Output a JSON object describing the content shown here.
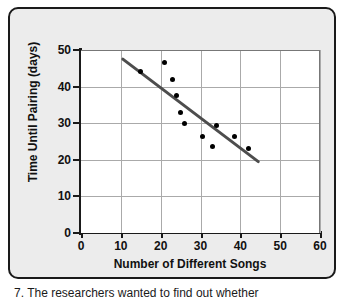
{
  "chart_data": {
    "type": "scatter",
    "title": "",
    "xlabel": "Number of Different Songs",
    "ylabel": "Time Until Pairing (days)",
    "xlim": [
      0,
      60
    ],
    "ylim": [
      0,
      50
    ],
    "xticks": [
      0,
      10,
      20,
      30,
      40,
      50,
      60
    ],
    "yticks": [
      0,
      10,
      20,
      30,
      40,
      50
    ],
    "grid": true,
    "legend": "none",
    "points": [
      {
        "x": 15,
        "y": 44
      },
      {
        "x": 21,
        "y": 46.5
      },
      {
        "x": 23,
        "y": 42
      },
      {
        "x": 24,
        "y": 37.5
      },
      {
        "x": 25,
        "y": 33
      },
      {
        "x": 26,
        "y": 30
      },
      {
        "x": 30.5,
        "y": 26.5
      },
      {
        "x": 33,
        "y": 23.5
      },
      {
        "x": 34,
        "y": 29.5
      },
      {
        "x": 38.5,
        "y": 26.5
      },
      {
        "x": 42,
        "y": 23
      }
    ],
    "trendline": {
      "x0": 10.5,
      "y0": 47.5,
      "x1": 44.5,
      "y1": 19.5,
      "color": "#4d4d4d"
    },
    "marker_color": "#000000",
    "grid_color": "#aaaaaa",
    "axis_color": "#1a1a1a"
  },
  "axis": {
    "y_title": "Time Until Pairing (days)",
    "x_title": "Number of Different Songs",
    "y_ticks": [
      "0",
      "10",
      "20",
      "30",
      "40",
      "50"
    ],
    "x_ticks": [
      "0",
      "10",
      "20",
      "30",
      "40",
      "50",
      "60"
    ]
  },
  "caption": {
    "text": "7. The researchers wanted to find out whether"
  },
  "colors": {
    "panel_background": "#ececec",
    "plot_background": "#ffffff",
    "axis": "#1a1a1a",
    "grid": "#aaaaaa",
    "trendline": "#4d4d4d",
    "marker": "#000000"
  }
}
